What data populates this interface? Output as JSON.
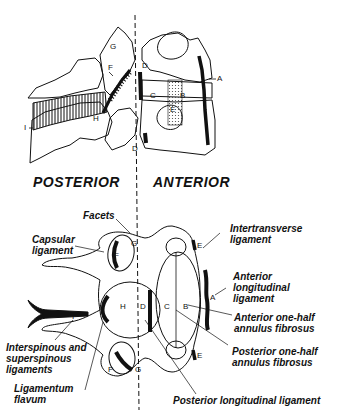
{
  "diagram": {
    "sections": {
      "posterior": "POSTERIOR",
      "anterior": "ANTERIOR"
    },
    "lateral_view_letters": {
      "A": "A",
      "B": "B",
      "C": "C",
      "D_top": "D",
      "D_bottom": "D",
      "E": "E",
      "F": "F",
      "G": "G",
      "H": "H",
      "I": "I"
    },
    "axial_view_letters": {
      "A": "A",
      "B": "B",
      "C": "C",
      "D": "D",
      "E_top": "E",
      "E_bottom": "E",
      "F_top": "F",
      "F_bottom": "F",
      "G_top": "G",
      "G_bottom": "G",
      "H": "H",
      "I": "I"
    },
    "callouts": {
      "facets": "Facets",
      "capsular_ligament": "Capsular\nligament",
      "intertransverse_ligament": "Intertransverse\nligament",
      "anterior_longitudinal_ligament": "Anterior\nlongitudinal\nligament",
      "anterior_annulus": "Anterior one-half\nannulus fibrosus",
      "posterior_annulus": "Posterior one-half\nannulus fibrosus",
      "interspinous": "Interspinous and\nsuperspinous\nligaments",
      "ligamentum_flavum": "Ligamentum\nflavum",
      "posterior_longitudinal_ligament": "Posterior longitudinal ligament"
    },
    "colors": {
      "ink": "#111111",
      "background": "#ffffff",
      "stipple": "#bbbbbb"
    }
  }
}
